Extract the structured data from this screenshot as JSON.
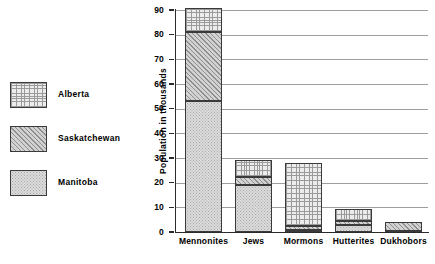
{
  "chart_data": {
    "type": "bar",
    "subtype": "stacked-vertical-bar",
    "title": "",
    "xlabel": "",
    "ylabel": "Population in thousands",
    "ylim": [
      0,
      90
    ],
    "yticks": [
      0,
      10,
      20,
      30,
      40,
      50,
      60,
      70,
      80,
      90
    ],
    "ytick_labels": [
      "0",
      "10",
      "20",
      "30",
      "40",
      "50",
      "60",
      "70",
      "80",
      "90"
    ],
    "grid": "horizontal",
    "legend_position": "left",
    "categories": [
      "Mennonites",
      "Jews",
      "Mormons",
      "Hutterites",
      "Dukhobors"
    ],
    "series": [
      {
        "name": "Manitoba",
        "values": [
          53,
          19,
          1,
          3,
          0.5
        ]
      },
      {
        "name": "Saskatchewan",
        "values": [
          28,
          3.5,
          1.5,
          1.5,
          3.5
        ]
      },
      {
        "name": "Alberta",
        "values": [
          10,
          6.5,
          25.5,
          5,
          0
        ]
      }
    ],
    "totals": [
      91,
      29,
      28,
      9.5,
      4
    ]
  },
  "legend": {
    "items": [
      {
        "label": "Alberta",
        "pattern": "cross-hatch-grid",
        "swatch_name": "legend-swatch-alberta"
      },
      {
        "label": "Saskatchewan",
        "pattern": "diagonal-hatch",
        "swatch_name": "legend-swatch-saskatchewan"
      },
      {
        "label": "Manitoba",
        "pattern": "fine-dots",
        "swatch_name": "legend-swatch-manitoba"
      }
    ]
  },
  "axes": {
    "y_title": "Population in thousands",
    "tick_labels": [
      "90",
      "80",
      "70",
      "60",
      "50",
      "40",
      "30",
      "20",
      "10",
      "0"
    ]
  },
  "colors": {
    "background": "#ffffff",
    "axis": "#2b2b2b",
    "gridline": "#9d9d9d",
    "bar_outline": "#3a3a3a",
    "manitoba_fill": "#dcdcdc",
    "saskatchewan_fill": "#d2d2d2",
    "alberta_fill": "#ececec",
    "text": "#000000"
  }
}
